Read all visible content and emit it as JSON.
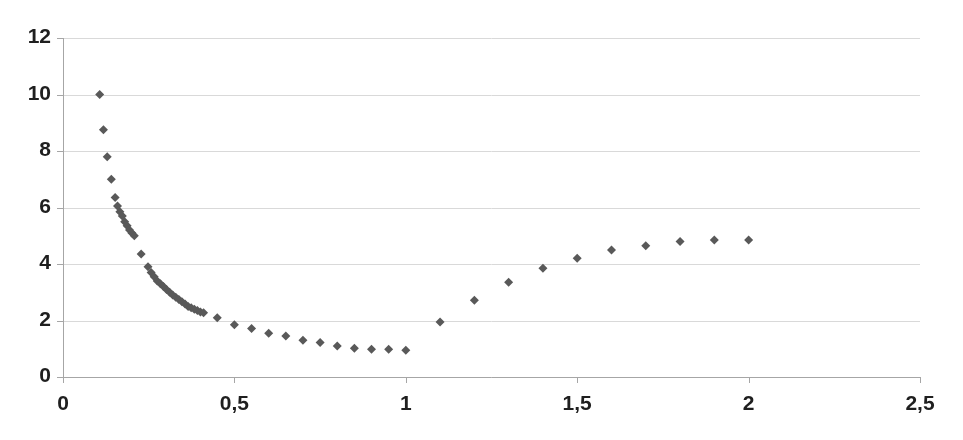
{
  "chart_data": {
    "type": "scatter",
    "title": "",
    "subtitle": "",
    "xlabel": "",
    "ylabel": "",
    "xlim": [
      0,
      2.5
    ],
    "ylim": [
      0,
      12
    ],
    "grid": true,
    "grid_axis": "y",
    "legend": false,
    "legend_position": "none",
    "decimal_separator": ",",
    "marker": "diamond",
    "marker_color": "#595959",
    "marker_size": 9,
    "axis_color": "#a6a6a6",
    "grid_color": "#d9d9d9",
    "tick_label_color": "#1f1f1f",
    "background": "#ffffff",
    "xticks": [
      0,
      0.5,
      1,
      1.5,
      2,
      2.5
    ],
    "xtick_labels": [
      "0",
      "0,5",
      "1",
      "1,5",
      "2",
      "2,5"
    ],
    "yticks": [
      0,
      2,
      4,
      6,
      8,
      10,
      12
    ],
    "ytick_labels": [
      "0",
      "2",
      "4",
      "6",
      "8",
      "10",
      "12"
    ],
    "series": [
      {
        "name": "series-1",
        "color": "#595959",
        "points": [
          [
            0.107,
            10.0
          ],
          [
            0.118,
            8.75
          ],
          [
            0.129,
            7.8
          ],
          [
            0.141,
            7.0
          ],
          [
            0.152,
            6.35
          ],
          [
            0.159,
            6.05
          ],
          [
            0.166,
            5.85
          ],
          [
            0.173,
            5.7
          ],
          [
            0.18,
            5.5
          ],
          [
            0.187,
            5.35
          ],
          [
            0.194,
            5.2
          ],
          [
            0.201,
            5.1
          ],
          [
            0.208,
            5.0
          ],
          [
            0.228,
            4.35
          ],
          [
            0.248,
            3.9
          ],
          [
            0.257,
            3.7
          ],
          [
            0.266,
            3.55
          ],
          [
            0.275,
            3.4
          ],
          [
            0.284,
            3.3
          ],
          [
            0.293,
            3.2
          ],
          [
            0.302,
            3.1
          ],
          [
            0.311,
            3.0
          ],
          [
            0.32,
            2.9
          ],
          [
            0.329,
            2.82
          ],
          [
            0.338,
            2.74
          ],
          [
            0.347,
            2.66
          ],
          [
            0.356,
            2.58
          ],
          [
            0.365,
            2.5
          ],
          [
            0.374,
            2.45
          ],
          [
            0.383,
            2.4
          ],
          [
            0.392,
            2.35
          ],
          [
            0.401,
            2.3
          ],
          [
            0.41,
            2.27
          ],
          [
            0.45,
            2.1
          ],
          [
            0.5,
            1.85
          ],
          [
            0.55,
            1.72
          ],
          [
            0.6,
            1.55
          ],
          [
            0.65,
            1.45
          ],
          [
            0.7,
            1.3
          ],
          [
            0.75,
            1.22
          ],
          [
            0.8,
            1.1
          ],
          [
            0.85,
            1.02
          ],
          [
            0.9,
            0.98
          ],
          [
            0.95,
            0.98
          ],
          [
            1.0,
            0.95
          ],
          [
            1.1,
            1.95
          ],
          [
            1.2,
            2.72
          ],
          [
            1.3,
            3.35
          ],
          [
            1.4,
            3.85
          ],
          [
            1.5,
            4.2
          ],
          [
            1.6,
            4.5
          ],
          [
            1.7,
            4.65
          ],
          [
            1.8,
            4.8
          ],
          [
            1.9,
            4.85
          ],
          [
            2.0,
            4.85
          ]
        ]
      }
    ]
  },
  "plot_geometry": {
    "left_px": 63,
    "right_px": 920,
    "top_px": 38,
    "bottom_px": 377
  }
}
